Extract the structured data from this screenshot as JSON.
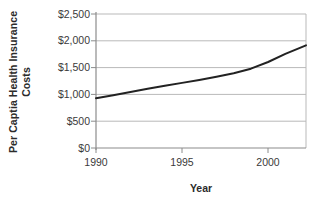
{
  "chart_data": {
    "type": "line",
    "title": "",
    "xlabel": "Year",
    "ylabel": "Per Captia Health Insurance Costs",
    "ylabel_line1": "Per Captia Health Insurance",
    "ylabel_line2": "Costs",
    "xlim": [
      1990,
      2002.2
    ],
    "ylim": [
      0,
      2500
    ],
    "xticks": [
      1990,
      1995,
      2000
    ],
    "xtick_labels": [
      "1990",
      "1995",
      "2000"
    ],
    "yticks": [
      0,
      500,
      1000,
      1500,
      2000,
      2500
    ],
    "ytick_labels": [
      "$0",
      "$500",
      "$1,000",
      "$1,500",
      "$2,000",
      "$2,500"
    ],
    "grid": "horizontal",
    "legend": "none",
    "series": [
      {
        "name": "Per Capita Health Insurance Costs",
        "color": "#222222",
        "x": [
          1990,
          1991,
          1992,
          1993,
          1994,
          1995,
          1996,
          1997,
          1998,
          1999,
          2000,
          2001,
          2002.2
        ],
        "values": [
          930,
          985,
          1045,
          1105,
          1160,
          1215,
          1270,
          1330,
          1395,
          1480,
          1605,
          1755,
          1915
        ]
      }
    ]
  },
  "axis": {
    "y_ticks": [
      {
        "label": "$2,500",
        "value": 2500
      },
      {
        "label": "$2,000",
        "value": 2000
      },
      {
        "label": "$1,500",
        "value": 1500
      },
      {
        "label": "$1,000",
        "value": 1000
      },
      {
        "label": "$500",
        "value": 500
      },
      {
        "label": "$0",
        "value": 0
      }
    ],
    "x_ticks": [
      {
        "label": "1990",
        "value": 1990
      },
      {
        "label": "1995",
        "value": 1995
      },
      {
        "label": "2000",
        "value": 2000
      }
    ]
  },
  "colors": {
    "line": "#222222",
    "grid": "#b9b9b9",
    "axis": "#8c8c8c",
    "text": "#3a3a3a",
    "title_text": "#2b2b2b",
    "background": "#ffffff"
  }
}
